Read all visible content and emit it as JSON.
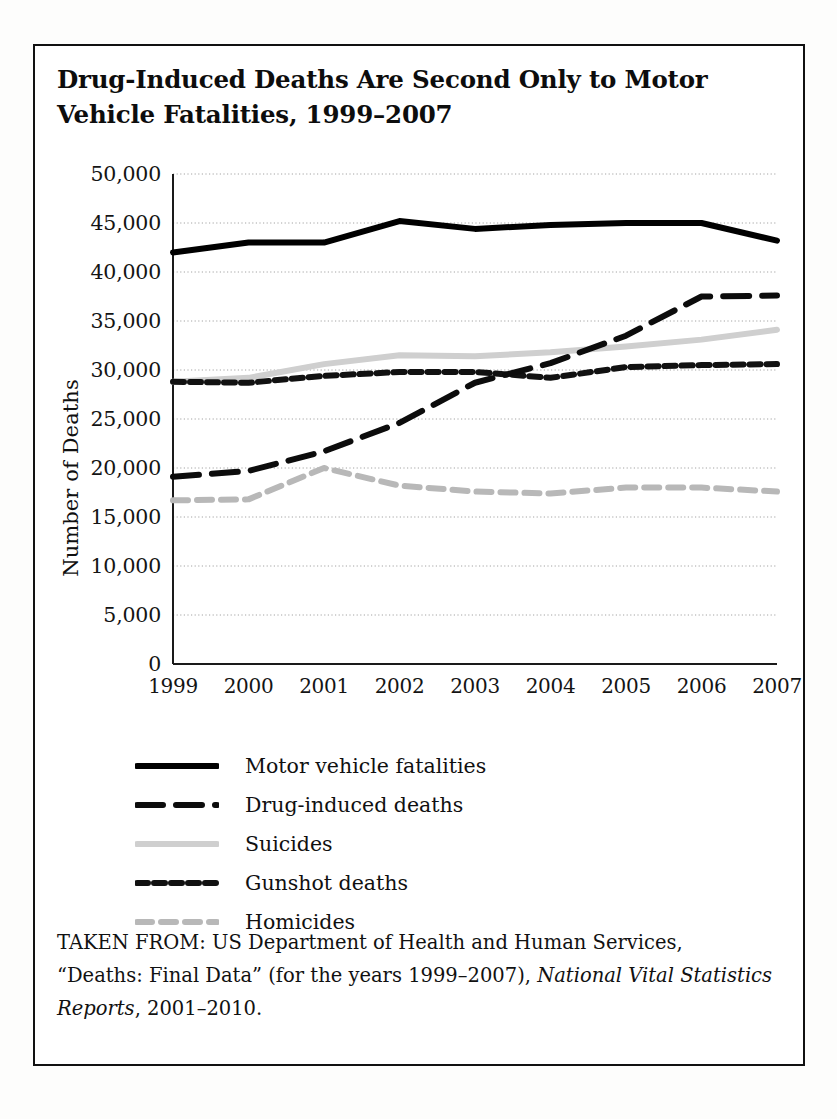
{
  "figure": {
    "title": "Drug-Induced Deaths Are Second Only to Motor Vehicle Fatalities, 1999–2007",
    "source_prefix": "TAKEN FROM: US Department of Health and Human Services, “Deaths: Final Data” (for the years 1999–2007), ",
    "source_italic": "National Vital Statistics Reports",
    "source_suffix": ", 2001–2010."
  },
  "chart_data": {
    "type": "line",
    "title": "Drug-Induced Deaths Are Second Only to Motor Vehicle Fatalities, 1999–2007",
    "xlabel": "",
    "ylabel": "Number of Deaths",
    "x": [
      1999,
      2000,
      2001,
      2002,
      2003,
      2004,
      2005,
      2006,
      2007
    ],
    "categories": [
      "1999",
      "2000",
      "2001",
      "2002",
      "2003",
      "2004",
      "2005",
      "2006",
      "2007"
    ],
    "ylim": [
      0,
      50000
    ],
    "ytick_step": 5000,
    "yticks": [
      50000,
      45000,
      40000,
      35000,
      30000,
      25000,
      20000,
      15000,
      10000,
      5000,
      0
    ],
    "ytick_labels": [
      "50,000",
      "45,000",
      "40,000",
      "35,000",
      "30,000",
      "25,000",
      "20,000",
      "15,000",
      "10,000",
      "5,000",
      "0"
    ],
    "grid": true,
    "grid_axis": "y",
    "legend_position": "below",
    "series": [
      {
        "name": "Motor vehicle fatalities",
        "style": "solid",
        "color": "#000000",
        "width": 6,
        "values": [
          42000,
          43000,
          43000,
          45200,
          44400,
          44800,
          45000,
          45000,
          43200
        ]
      },
      {
        "name": "Drug-induced deaths",
        "style": "long-dash",
        "color": "#0c0c0c",
        "width": 6,
        "values": [
          19100,
          19700,
          21700,
          24600,
          28700,
          30700,
          33500,
          37500,
          37600
        ]
      },
      {
        "name": "Suicides",
        "style": "solid",
        "color": "#cfcfcf",
        "width": 6,
        "values": [
          28800,
          29200,
          30600,
          31500,
          31400,
          31800,
          32400,
          33100,
          34100
        ]
      },
      {
        "name": "Gunshot deaths",
        "style": "short-dash",
        "color": "#111111",
        "width": 6,
        "values": [
          28800,
          28700,
          29400,
          29800,
          29800,
          29200,
          30300,
          30500,
          30600
        ]
      },
      {
        "name": "Homicides",
        "style": "gray-dash",
        "color": "#b8b8b8",
        "width": 6,
        "values": [
          16700,
          16800,
          20000,
          18200,
          17600,
          17400,
          18000,
          18000,
          17600
        ]
      }
    ]
  }
}
